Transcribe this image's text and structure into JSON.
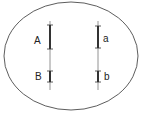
{
  "diagram": {
    "title": "",
    "cell": {
      "shape": "ellipse"
    },
    "chromosomes": [
      {
        "id": "left",
        "genes": [
          {
            "label": "A"
          },
          {
            "label": "B"
          }
        ]
      },
      {
        "id": "right",
        "genes": [
          {
            "label": "a"
          },
          {
            "label": "b"
          }
        ]
      }
    ]
  }
}
